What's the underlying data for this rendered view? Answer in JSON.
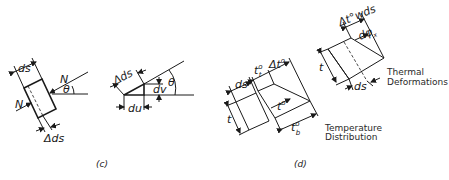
{
  "figure": {
    "panel_c": {
      "caption": "(c)",
      "element_labels": {
        "ds": "ds",
        "delta_ds": "Δds",
        "normal_force_top": "N",
        "normal_force_left": "N",
        "theta": "θ"
      },
      "triangle_labels": {
        "delta_ds": "Δds",
        "dv": "dv",
        "du": "du",
        "theta": "θ"
      }
    },
    "panel_d": {
      "caption": "(d)",
      "temperature_distribution": {
        "title_line1": "Temperature",
        "title_line2": "Distribution",
        "ds": "ds",
        "t": "t",
        "t_top": "t",
        "t_top_sup": "o",
        "t_top_sub": "t",
        "delta_t": "Δt",
        "delta_t_sup": "o",
        "t_mid": "t",
        "t_mid_sup": "o",
        "t_bottom": "t",
        "t_bottom_sup": "o",
        "t_bottom_sub": "b"
      },
      "thermal_deformations": {
        "title_line1": "Thermal",
        "title_line2": "Deformations",
        "delta_t_w_ds": "Δt°wds",
        "dphi": "dφ",
        "dphi_sub": "x",
        "t": "t",
        "ds": "ds"
      }
    }
  }
}
